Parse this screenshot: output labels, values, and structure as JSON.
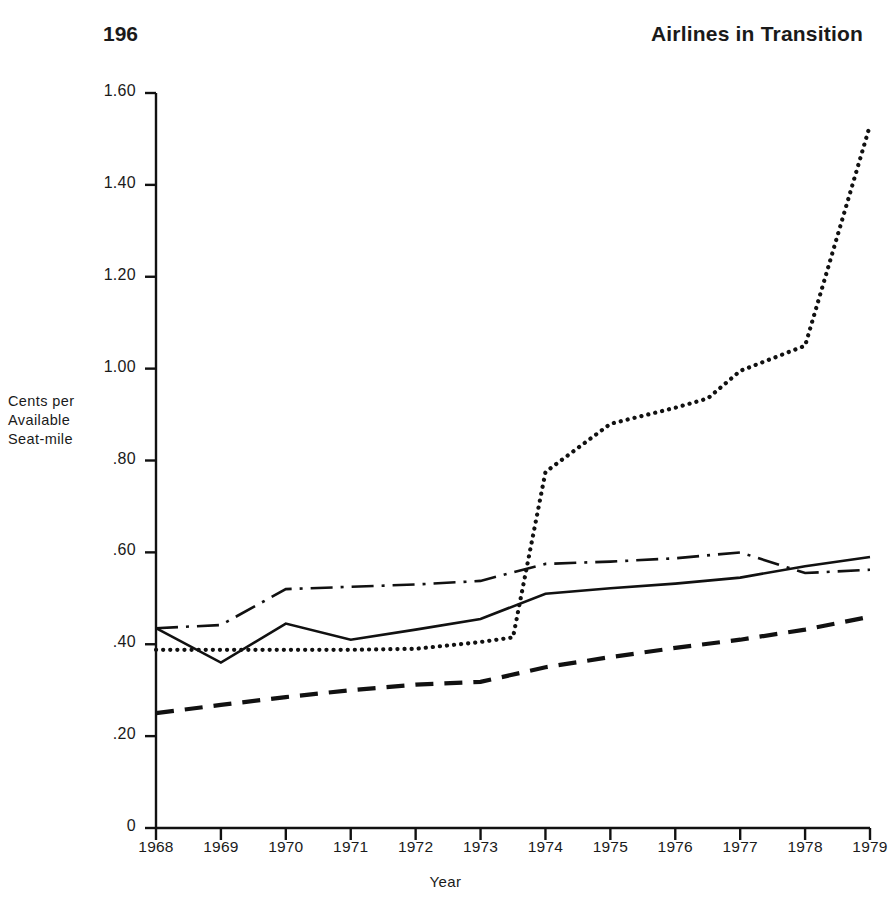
{
  "header": {
    "page_number": "196",
    "running_head": "Airlines in Transition"
  },
  "chart_data": {
    "type": "line",
    "title": "",
    "xlabel": "Year",
    "ylabel": "Cents per\nAvailable\nSeat-mile",
    "x": [
      1968,
      1969,
      1970,
      1971,
      1972,
      1973,
      1974,
      1975,
      1976,
      1977,
      1978,
      1979
    ],
    "xtick_labels": [
      "1968",
      "1969",
      "1970",
      "1971",
      "1972",
      "1973",
      "1974",
      "1975",
      "1976",
      "1977",
      "1978",
      "1979"
    ],
    "ytick_labels": [
      "1.60",
      "1.40",
      "1.20",
      "1.00",
      ".80",
      ".60",
      ".40",
      ".20",
      "0"
    ],
    "ytick_values": [
      1.6,
      1.4,
      1.2,
      1.0,
      0.8,
      0.6,
      0.4,
      0.2,
      0
    ],
    "ylim": [
      0,
      1.6
    ],
    "xlim": [
      1968,
      1979
    ],
    "grid": false,
    "legend": "none",
    "series": [
      {
        "name": "solid-series",
        "style": "solid",
        "values": [
          0.435,
          0.36,
          0.445,
          0.41,
          0.432,
          0.455,
          0.51,
          0.522,
          0.532,
          0.545,
          0.57,
          0.59
        ]
      },
      {
        "name": "dash-dot-series",
        "style": "dash-dot",
        "values": [
          0.435,
          0.442,
          0.52,
          0.525,
          0.53,
          0.538,
          0.575,
          0.58,
          0.587,
          0.6,
          0.555,
          0.562
        ]
      },
      {
        "name": "dotted-series",
        "style": "dotted",
        "values": [
          0.388,
          0.388,
          0.388,
          0.388,
          0.39,
          0.405,
          0.775,
          0.88,
          0.915,
          0.995,
          1.05,
          1.53
        ],
        "extra_points": [
          {
            "x": 1973.5,
            "y": 0.415
          },
          {
            "x": 1976.5,
            "y": 0.935
          }
        ]
      },
      {
        "name": "dashed-series",
        "style": "dashed",
        "values": [
          0.25,
          0.268,
          0.285,
          0.3,
          0.312,
          0.318,
          0.35,
          0.372,
          0.392,
          0.41,
          0.432,
          0.46
        ]
      }
    ]
  }
}
